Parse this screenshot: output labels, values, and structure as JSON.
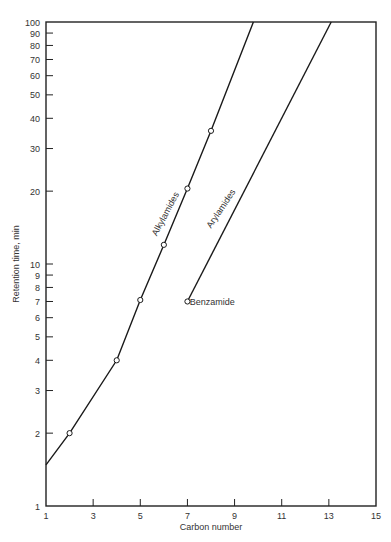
{
  "chart_data": {
    "type": "line",
    "title": "",
    "xlabel": "Carbon number",
    "ylabel": "Retention time, min",
    "xlim": [
      1,
      15
    ],
    "ylim": [
      1,
      100
    ],
    "yscale": "log",
    "grid": false,
    "x_ticks": [
      1,
      3,
      5,
      7,
      9,
      11,
      13,
      15
    ],
    "y_ticks": [
      1,
      2,
      3,
      4,
      5,
      6,
      7,
      8,
      9,
      10,
      20,
      30,
      40,
      50,
      60,
      70,
      80,
      90,
      100
    ],
    "series": [
      {
        "name": "Alkylamides",
        "line": [
          [
            1,
            1.48
          ],
          [
            2,
            2.0
          ],
          [
            4,
            4.0
          ],
          [
            5,
            7.1
          ],
          [
            6,
            12.0
          ],
          [
            7,
            20.5
          ],
          [
            8,
            35.5
          ],
          [
            9.8,
            100
          ]
        ],
        "markers": [
          [
            2,
            2.0
          ],
          [
            4,
            4.0
          ],
          [
            5,
            7.1
          ],
          [
            6,
            12.0
          ],
          [
            7,
            20.5
          ],
          [
            8,
            35.5
          ]
        ]
      },
      {
        "name": "Arylamides",
        "line": [
          [
            7,
            7.0
          ],
          [
            13.1,
            100
          ]
        ],
        "markers": [
          [
            7,
            7.0
          ]
        ]
      }
    ],
    "annotations": [
      {
        "text": "Alkylamides",
        "x": 5.7,
        "y": 13,
        "rotation": -62
      },
      {
        "text": "Arylamides",
        "x": 8.0,
        "y": 14,
        "rotation": -56
      },
      {
        "text": "Benzamide",
        "x": 7.1,
        "y": 6.8
      }
    ]
  }
}
